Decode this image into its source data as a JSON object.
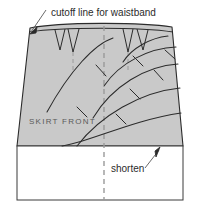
{
  "figure": {
    "kind": "sewing-pattern-diagram",
    "background_color": "#ffffff",
    "pattern_fill_color": "#c9c9c9",
    "pattern_stroke_color": "#2b2b2b",
    "dashed_line_color": "#9a9a9a",
    "text_color": "#2b2b2b",
    "muted_text_color": "#5a5a5a"
  },
  "labels": {
    "cutoff_line": "cutoff line for waistband",
    "skirt_front": "SKIRT FRONT",
    "shorten": "shorten"
  },
  "annotations": {
    "cutoff_arrow": {
      "name": "cutoff-line-arrow",
      "points_to": "waistband cutoff line at upper left of skirt"
    },
    "shorten_arrow": {
      "name": "shorten-arrow",
      "points_to": "lower hem edge of shaded skirt front"
    }
  },
  "pattern_elements": {
    "darts_count": 4,
    "flare_arcs_count": 5,
    "center_front_line": "dashed vertical",
    "lengthen_shorten_box": "white rectangle below skirt front"
  }
}
